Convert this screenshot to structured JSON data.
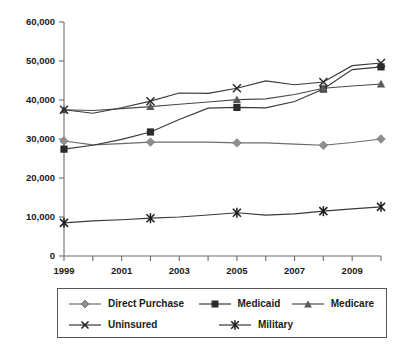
{
  "chart_data": {
    "type": "line",
    "title": "",
    "subtitle": "",
    "xlabel": "",
    "ylabel": "",
    "xlim": [
      1999,
      2010
    ],
    "ylim": [
      0,
      60000
    ],
    "grid": false,
    "legend_position": "bottom",
    "x": [
      1999,
      2000,
      2001,
      2002,
      2003,
      2004,
      2005,
      2006,
      2007,
      2008,
      2009,
      2010
    ],
    "x_tick_labels": [
      "1999",
      "2001",
      "2003",
      "2005",
      "2007",
      "2009"
    ],
    "x_tick_values": [
      1999,
      2001,
      2003,
      2005,
      2007,
      2009
    ],
    "y_tick_labels": [
      "0",
      "10,000",
      "20,000",
      "30,000",
      "40,000",
      "50,000",
      "60,000"
    ],
    "y_tick_values": [
      0,
      10000,
      20000,
      30000,
      40000,
      50000,
      60000
    ],
    "marker_years": [
      1999,
      2002,
      2005,
      2008,
      2010
    ],
    "series": [
      {
        "name": "Direct Purchase",
        "marker": "diamond",
        "color": "#8f8f8f",
        "line_color": "#6b6b6b",
        "values": [
          29500,
          28500,
          28800,
          29200,
          29200,
          29200,
          29000,
          29000,
          28700,
          28400,
          29100,
          30000
        ]
      },
      {
        "name": "Medicaid",
        "marker": "square",
        "color": "#2b2b2b",
        "line_color": "#3a3a3a",
        "values": [
          27400,
          28400,
          29900,
          31800,
          35000,
          37900,
          38100,
          38000,
          39600,
          42800,
          47800,
          48500
        ]
      },
      {
        "name": "Medicare",
        "marker": "triangle",
        "color": "#5a5a5a",
        "line_color": "#4a4a4a",
        "values": [
          37500,
          37300,
          37800,
          38300,
          38900,
          39500,
          40100,
          40300,
          41400,
          43000,
          43600,
          44100
        ]
      },
      {
        "name": "Uninsured",
        "marker": "x",
        "color": "#2b2b2b",
        "line_color": "#3a3a3a",
        "values": [
          37500,
          36600,
          38000,
          39700,
          41800,
          41700,
          43000,
          44900,
          43900,
          44600,
          48800,
          49500
        ]
      },
      {
        "name": "Military",
        "marker": "asterisk",
        "color": "#1a1a1a",
        "line_color": "#3a3a3a",
        "values": [
          8500,
          9000,
          9300,
          9700,
          10000,
          10500,
          11100,
          10500,
          10800,
          11500,
          12100,
          12600
        ]
      }
    ]
  },
  "legend": {
    "items": [
      {
        "label": "Direct Purchase",
        "marker": "diamond"
      },
      {
        "label": "Medicaid",
        "marker": "square"
      },
      {
        "label": "Medicare",
        "marker": "triangle"
      },
      {
        "label": "Uninsured",
        "marker": "x"
      },
      {
        "label": "Military",
        "marker": "asterisk"
      }
    ]
  },
  "axis": {
    "y_labels": [
      "60,000",
      "50,000",
      "40,000",
      "30,000",
      "20,000",
      "10,000",
      "0"
    ],
    "x_labels": [
      "1999",
      "2001",
      "2003",
      "2005",
      "2007",
      "2009"
    ]
  },
  "colors": {
    "axis": "#6d6d6d",
    "text": "#1a1a1a",
    "gray_series": "#8f8f8f",
    "dark_series": "#2b2b2b",
    "background": "#ffffff"
  }
}
